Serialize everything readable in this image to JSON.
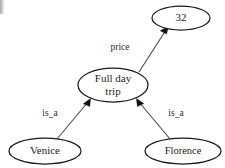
{
  "figure": {
    "kind": "semantic-network",
    "background_color": "#ffffff",
    "node_stroke_color": "#1a1a1a",
    "edge_stroke_color": "#4a4a4a",
    "text_color": "#1c1c1c"
  },
  "nodes": {
    "value": {
      "label": "32",
      "cx": 181,
      "cy": 18,
      "rx": 29,
      "ry": 12
    },
    "concept": {
      "label_line1": "Full day",
      "label_line2": "trip",
      "cx": 113,
      "cy": 85,
      "rx": 35,
      "ry": 17
    },
    "city_left": {
      "label": "Venice",
      "cx": 45,
      "cy": 151,
      "rx": 36,
      "ry": 13
    },
    "city_right": {
      "label": "Florence",
      "cx": 183,
      "cy": 151,
      "rx": 38,
      "ry": 13
    }
  },
  "edges": {
    "price": {
      "label": "price",
      "from": "concept",
      "to": "value",
      "label_x": 120,
      "label_y": 48
    },
    "is_a_left": {
      "label": "is_a",
      "from": "city_left",
      "to": "concept",
      "label_x": 50,
      "label_y": 114
    },
    "is_a_right": {
      "label": "is_a",
      "from": "city_right",
      "to": "concept",
      "label_x": 176,
      "label_y": 114
    }
  }
}
